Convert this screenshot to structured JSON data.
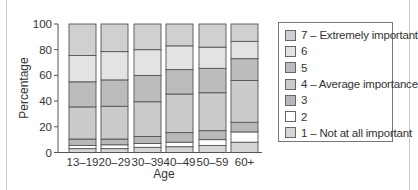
{
  "chart_data": {
    "type": "bar",
    "stacked": true,
    "title": "",
    "xlabel": "Age",
    "ylabel": "Percentage",
    "ylim": [
      0,
      100
    ],
    "yticks": [
      0,
      20,
      40,
      60,
      80,
      100
    ],
    "grid": false,
    "legend_position": "right",
    "categories": [
      "13–19",
      "20–29",
      "30–39",
      "40–49",
      "50–59",
      "60+"
    ],
    "series": [
      {
        "name": "1 – Not at all important",
        "color": "#d6d6d6",
        "values": [
          3,
          3,
          4,
          4.5,
          5.5,
          8
        ]
      },
      {
        "name": "2",
        "color": "#ffffff",
        "values": [
          2.5,
          3,
          3,
          3.5,
          4.5,
          8
        ]
      },
      {
        "name": "3",
        "color": "#b8b8b8",
        "values": [
          5,
          4.5,
          5.5,
          7.5,
          7,
          7.5
        ]
      },
      {
        "name": "4 – Average importance",
        "color": "#cbcbcb",
        "values": [
          25,
          25.5,
          27,
          30,
          29.5,
          32.5
        ]
      },
      {
        "name": "5",
        "color": "#bcbcbc",
        "values": [
          19.5,
          20.5,
          20.5,
          19,
          19,
          17
        ]
      },
      {
        "name": "6",
        "color": "#e3e3e3",
        "values": [
          20.5,
          22,
          20,
          18.5,
          16.5,
          13.5
        ]
      },
      {
        "name": "7 – Extremely important",
        "color": "#d0d0d0",
        "values": [
          24.5,
          21.5,
          20,
          17,
          18,
          13.5
        ]
      }
    ]
  },
  "legend": {
    "items": [
      {
        "label": "7 – Extremely important",
        "color": "#d0d0d0"
      },
      {
        "label": "6",
        "color": "#e3e3e3"
      },
      {
        "label": "5",
        "color": "#bcbcbc"
      },
      {
        "label": "4 – Average importance",
        "color": "#cbcbcb"
      },
      {
        "label": "3",
        "color": "#b8b8b8"
      },
      {
        "label": "2",
        "color": "#ffffff"
      },
      {
        "label": "1 – Not at all important",
        "color": "#d6d6d6"
      }
    ]
  },
  "axes": {
    "x_title": "Age",
    "y_title": "Percentage"
  }
}
